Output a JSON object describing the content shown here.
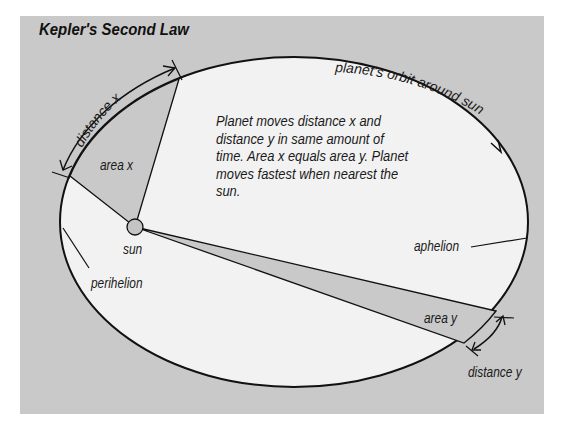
{
  "title": "Kepler's Second Law",
  "description": "Planet moves distance x and distance y in same amount of time. Area x equals area y. Planet moves fastest when nearest the sun.",
  "labels": {
    "orbit": "planet's orbit around sun",
    "distance_x": "distance x",
    "area_x": "area x",
    "sun": "sun",
    "perihelion": "perihelion",
    "aphelion": "aphelion",
    "area_y": "area y",
    "distance_y": "distance y"
  },
  "colors": {
    "background_panel": "#c9c9c9",
    "orbit_fill": "#f2f2f2",
    "area_fill": "#c9c9c9",
    "sun_fill": "#c4c4c4",
    "line": "#111111"
  }
}
